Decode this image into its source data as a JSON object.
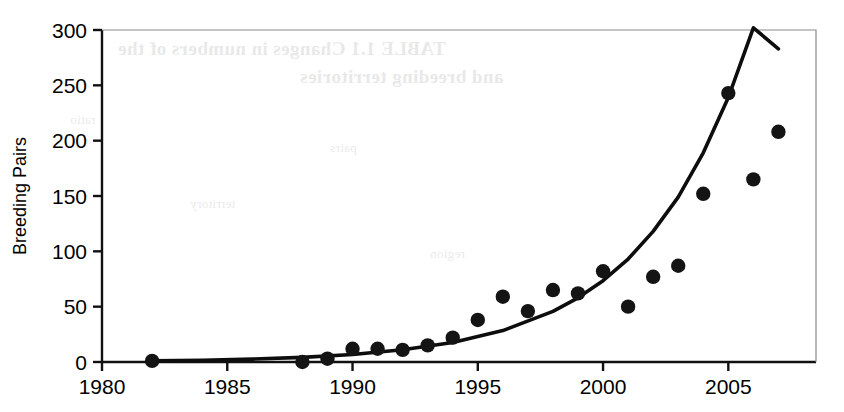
{
  "chart_data": {
    "type": "scatter",
    "title": "",
    "xlabel": "",
    "ylabel": "Breeding Pairs",
    "xlim": [
      1980,
      2008.5
    ],
    "ylim": [
      0,
      300
    ],
    "xticks": [
      1980,
      1985,
      1990,
      1995,
      2000,
      2005
    ],
    "yticks": [
      0,
      50,
      100,
      150,
      200,
      250,
      300
    ],
    "xtick_labels": [
      "1980",
      "1985",
      "1990",
      "1995",
      "2000",
      "2005"
    ],
    "ytick_labels": [
      "0",
      "50",
      "100",
      "150",
      "200",
      "250",
      "300"
    ],
    "grid": false,
    "legend": false,
    "marker": "filled-circle",
    "marker_color": "#141414",
    "series": [
      {
        "name": "Breeding pairs observed",
        "type": "scatter",
        "x": [
          1982,
          1988,
          1989,
          1990,
          1991,
          1992,
          1993,
          1994,
          1995,
          1996,
          1997,
          1998,
          1999,
          2000,
          2001,
          2002,
          2003,
          2004,
          2005,
          2006,
          2007
        ],
        "values": [
          1,
          0,
          3,
          12,
          12,
          11,
          15,
          22,
          38,
          59,
          46,
          65,
          62,
          82,
          50,
          77,
          87,
          152,
          243,
          165,
          208
        ]
      },
      {
        "name": "Fitted exponential trend",
        "type": "line",
        "line_color": "#0d0d0d",
        "x": [
          1982,
          1984,
          1986,
          1988,
          1990,
          1992,
          1994,
          1996,
          1998,
          1999,
          2000,
          2001,
          2002,
          2003,
          2004,
          2005,
          2006,
          2007
        ],
        "values": [
          1,
          1.6,
          2.6,
          4.2,
          6.8,
          11,
          17.6,
          28.4,
          45.7,
          58,
          73.5,
          93,
          118,
          149,
          189,
          239,
          302,
          283
        ]
      }
    ]
  },
  "axes": {
    "y_axis_title": "Breeding Pairs"
  },
  "bleed_through": {
    "line_1": "TABLE 1.1 Changes in numbers of the",
    "line_2": "and breeding territories",
    "line_3": "ratio",
    "line_4": "pairs",
    "line_5": "territory",
    "line_6": "region"
  }
}
